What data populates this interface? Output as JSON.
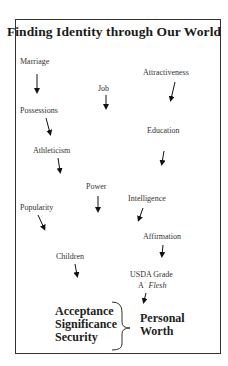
{
  "title": "Finding Identity through Our World",
  "influences": [
    {
      "label": "Marriage",
      "x": 20,
      "y": 57
    },
    {
      "label": "Job",
      "x": 98,
      "y": 84
    },
    {
      "label": "Attractiveness",
      "x": 143,
      "y": 68
    },
    {
      "label": "Possessions",
      "x": 20,
      "y": 106
    },
    {
      "label": "Education",
      "x": 147,
      "y": 126
    },
    {
      "label": "Athleticism",
      "x": 33,
      "y": 146
    },
    {
      "label": "Power",
      "x": 86,
      "y": 182
    },
    {
      "label": "Intelligence",
      "x": 128,
      "y": 194
    },
    {
      "label": "Popularity",
      "x": 20,
      "y": 203
    },
    {
      "label": "Affirmation",
      "x": 143,
      "y": 232
    },
    {
      "label": "Children",
      "x": 56,
      "y": 252
    },
    {
      "label": "USDA Grade",
      "x": 130,
      "y": 270
    }
  ],
  "usda_line2": {
    "prefix": "A",
    "sup": "+",
    "italic": "Flesh"
  },
  "needs": [
    "Acceptance",
    "Significance",
    "Security"
  ],
  "result": [
    "Personal",
    "Worth"
  ]
}
